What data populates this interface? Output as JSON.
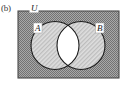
{
  "figure": {
    "caption": "(b)",
    "type": "venn-diagram"
  },
  "labels": {
    "universe": "U",
    "set_a": "A",
    "set_b": "B"
  },
  "colors": {
    "universe_fill": "#9e9e9e",
    "universe_pattern": "#6f6f6f",
    "circle_fill": "#d8d8d8",
    "circle_pattern": "#b4b4b4",
    "intersection_fill": "#ffffff",
    "stroke": "#1a1a1a",
    "label_box": "#ffffff",
    "caption_color": "#3a3a3a"
  },
  "geometry": {
    "rect": {
      "x": 18,
      "y": 11,
      "width": 101,
      "height": 67
    },
    "circle_a": {
      "cx": 55,
      "cy": 45.5,
      "r": 24
    },
    "circle_b": {
      "cx": 81,
      "cy": 45.5,
      "r": 24
    },
    "label_a_pos": {
      "x": 36,
      "y": 31
    },
    "label_b_pos": {
      "x": 98,
      "y": 31
    },
    "label_u_pos": {
      "x": 34,
      "y": 10
    }
  },
  "shading": {
    "shaded_regions": [
      "universe-outside-circles",
      "set-a-only",
      "set-b-only"
    ],
    "unshaded_regions": [
      "a-intersect-b"
    ],
    "meaning": "shaded area represents the complement of A intersect B"
  }
}
